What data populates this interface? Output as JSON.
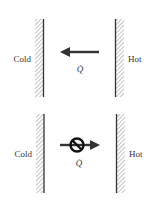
{
  "panels": [
    {
      "id": "allowed",
      "left_label": "Cold",
      "right_label": "Hot",
      "flow_label": "Q̇",
      "flow_direction": "hot-to-cold",
      "prohibited": false
    },
    {
      "id": "prohibited",
      "left_label": "Cold",
      "right_label": "Hot",
      "flow_label": "Q̇",
      "flow_direction": "cold-to-hot",
      "prohibited": true
    }
  ],
  "colors": {
    "wall": "#333333",
    "hatch": "#9a9a9a",
    "arrow": "#333333",
    "text": "#333333"
  }
}
